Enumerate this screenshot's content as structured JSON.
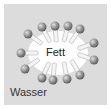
{
  "diagram": {
    "type": "micelle",
    "labels": {
      "center": "Fett",
      "outside": "Wasser"
    },
    "colors": {
      "background": "#dcdcdc",
      "core": "#ffffff",
      "head": "#8c8c8c",
      "tail": "#f2f2f2"
    },
    "molecule_count": 13
  }
}
